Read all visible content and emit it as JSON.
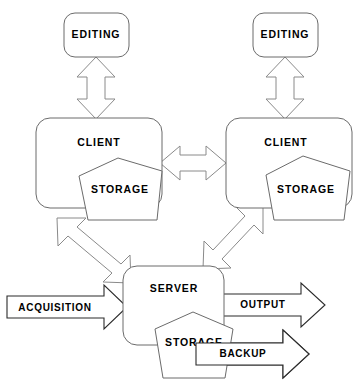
{
  "diagram": {
    "type": "architecture-block-diagram",
    "background_color": "#ffffff",
    "outline_color": "#6b6b6b",
    "arrow_outline_color": "#8a8a8a",
    "labeled_arrow_outline_color": "#2b2b2b",
    "text_color": "#000000",
    "nodes": {
      "editing_left": {
        "label": "EDITING",
        "shape": "rounded-rectangle"
      },
      "editing_right": {
        "label": "EDITING",
        "shape": "rounded-rectangle"
      },
      "client_left": {
        "label": "CLIENT",
        "shape": "rounded-rectangle"
      },
      "client_right": {
        "label": "CLIENT",
        "shape": "rounded-rectangle"
      },
      "storage_client_left": {
        "label": "STORAGE",
        "shape": "pentagon"
      },
      "storage_client_right": {
        "label": "STORAGE",
        "shape": "pentagon"
      },
      "server": {
        "label": "SERVER",
        "shape": "rounded-rectangle"
      },
      "storage_server": {
        "label": "STORAGE",
        "shape": "pentagon"
      }
    },
    "flows": {
      "acquisition": {
        "label": "ACQUISITION",
        "direction": "right",
        "style": "block-arrow"
      },
      "output": {
        "label": "OUTPUT",
        "direction": "right",
        "style": "block-arrow"
      },
      "backup": {
        "label": "BACKUP",
        "direction": "right",
        "style": "block-arrow"
      }
    },
    "connectors": [
      {
        "name": "editing-left-to-client-left",
        "style": "double-headed-vertical"
      },
      {
        "name": "editing-right-to-client-right",
        "style": "double-headed-vertical"
      },
      {
        "name": "client-left-to-client-right",
        "style": "double-headed-horizontal"
      },
      {
        "name": "client-left-to-server",
        "style": "double-headed-diagonal"
      },
      {
        "name": "client-right-to-server",
        "style": "double-headed-diagonal"
      }
    ]
  }
}
